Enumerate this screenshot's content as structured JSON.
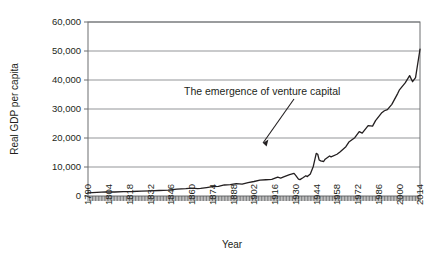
{
  "chart_data": {
    "type": "line",
    "title": "",
    "xlabel": "Year",
    "ylabel": "Real GDP per capita",
    "xlim": [
      1790,
      2014
    ],
    "ylim": [
      0,
      60000
    ],
    "grid": true,
    "legend": "none",
    "yticks": [
      0,
      10000,
      20000,
      30000,
      40000,
      50000,
      60000
    ],
    "ytick_labels": [
      "0",
      "10,000",
      "20,000",
      "30,000",
      "40,000",
      "50,000",
      "60,000"
    ],
    "xticks": [
      1790,
      1804,
      1818,
      1832,
      1846,
      1860,
      1874,
      1888,
      1902,
      1916,
      1930,
      1944,
      1958,
      1972,
      1986,
      2000,
      2014
    ],
    "xtick_labels": [
      "1790",
      "1804",
      "1818",
      "1832",
      "1846",
      "1860",
      "1874",
      "1888",
      "1902",
      "1916",
      "1930",
      "1944",
      "1958",
      "1972",
      "1986",
      "2000",
      "2014"
    ],
    "xtick_minor_step": 1,
    "annotations": [
      {
        "text": "The emergence of venture capital",
        "points_to_x": 1946,
        "points_to_y": 14800
      }
    ],
    "series": [
      {
        "name": "Real GDP per capita",
        "color": "#231f20",
        "x": [
          1790,
          1796,
          1802,
          1808,
          1814,
          1820,
          1826,
          1832,
          1838,
          1844,
          1850,
          1856,
          1860,
          1864,
          1866,
          1870,
          1874,
          1878,
          1882,
          1886,
          1890,
          1894,
          1898,
          1902,
          1906,
          1910,
          1914,
          1918,
          1920,
          1922,
          1926,
          1929,
          1930,
          1932,
          1933,
          1935,
          1937,
          1938,
          1940,
          1942,
          1944,
          1945,
          1946,
          1947,
          1949,
          1950,
          1953,
          1954,
          1958,
          1960,
          1964,
          1966,
          1970,
          1973,
          1975,
          1979,
          1982,
          1984,
          1988,
          1990,
          1992,
          1995,
          1999,
          2000,
          2004,
          2007,
          2009,
          2011,
          2014
        ],
        "y": [
          1100,
          1250,
          1400,
          1380,
          1500,
          1550,
          1700,
          1800,
          1900,
          2050,
          2350,
          2550,
          2750,
          2550,
          2600,
          2900,
          3200,
          3300,
          3800,
          3900,
          4300,
          4100,
          4600,
          5000,
          5500,
          5600,
          5700,
          6500,
          6200,
          6600,
          7400,
          7800,
          7200,
          5800,
          5650,
          6300,
          7000,
          6700,
          7600,
          10200,
          14700,
          14400,
          12400,
          12100,
          11900,
          12700,
          13800,
          13500,
          14400,
          15200,
          17000,
          18600,
          20100,
          22200,
          21700,
          24300,
          24100,
          26000,
          28600,
          29400,
          29800,
          31600,
          35400,
          36500,
          39000,
          41500,
          39400,
          40800,
          50600
        ]
      }
    ]
  },
  "axis_titles": {
    "x": "Year",
    "y": "Real GDP per capita"
  }
}
